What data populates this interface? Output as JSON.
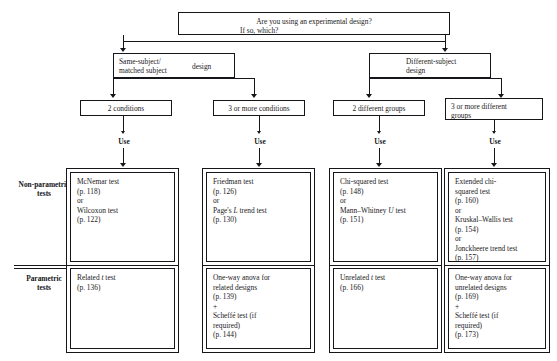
{
  "diagram": {
    "root": {
      "line1": "Are you using an experimental design?",
      "line2": "If so, which?"
    },
    "designs": [
      {
        "line1": "Same-subject/",
        "line2": "matched subject",
        "line3": "design"
      },
      {
        "line1": "Different-subject",
        "line2": "design"
      }
    ],
    "branches": [
      {
        "line1": "2 conditions",
        "line2": ""
      },
      {
        "line1": "3 or more conditions",
        "line2": ""
      },
      {
        "line1": "2 different groups",
        "line2": ""
      },
      {
        "line1": "3 or more different",
        "line2": "groups"
      }
    ],
    "use_labels": [
      "Use",
      "Use",
      "Use",
      "Use"
    ],
    "row_labels": [
      {
        "line1": "Non-parametric",
        "line2": "tests"
      },
      {
        "line1": "Parametric",
        "line2": "tests"
      }
    ],
    "nonparametric": [
      {
        "lines": [
          "McNemar test",
          "(p. 118)",
          "or",
          "Wilcoxon test",
          "(p. 122)"
        ]
      },
      {
        "lines": [
          "Friedman test",
          "(p. 126)",
          "or",
          "Page's L trend test",
          "(p. 130)"
        ]
      },
      {
        "lines": [
          "Chi-squared test",
          "(p. 148)",
          "or",
          "Mann–Whitney U test",
          "(p. 151)"
        ]
      },
      {
        "lines": [
          "Extended chi-",
          "squared test",
          "(p. 160)",
          "or",
          "Kruskal–Wallis test",
          "(p. 154)",
          "or",
          "Jonckheere trend test",
          "(p. 157)"
        ]
      }
    ],
    "parametric": [
      {
        "lines": [
          "Related t test",
          "(p. 136)"
        ]
      },
      {
        "lines": [
          "One-way anova for",
          "related designs",
          "(p. 139)",
          "+",
          "Scheffé test (if",
          "required)",
          "(p. 144)"
        ]
      },
      {
        "lines": [
          "Unrelated t test",
          "(p. 166)"
        ]
      },
      {
        "lines": [
          "One-way anova for",
          "unrelated designs",
          "(p. 169)",
          "+",
          "Scheffé test (if",
          "required)",
          "(p. 173)"
        ]
      }
    ],
    "colors": {
      "ink": "#15161a",
      "background": "#ffffff"
    }
  }
}
